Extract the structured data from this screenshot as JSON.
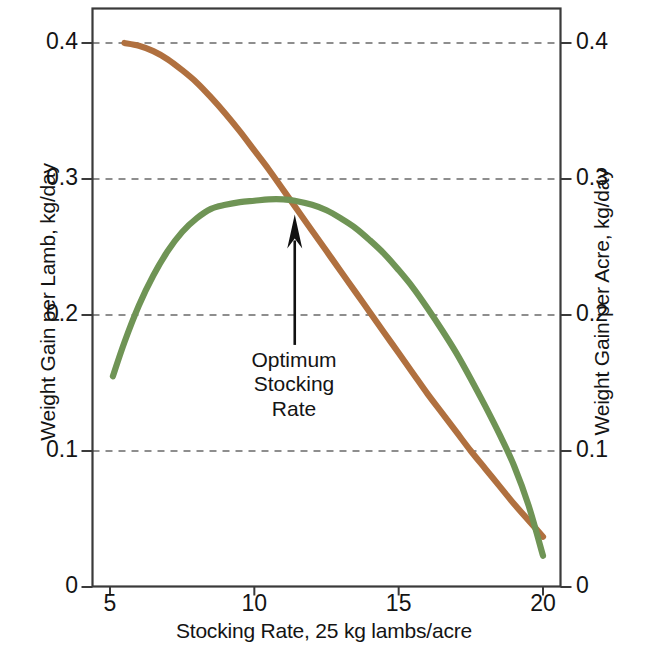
{
  "chart_data": {
    "type": "line",
    "title": "",
    "xlabel": "Stocking Rate, 25 kg lambs/acre",
    "ylabel": "Weight Gain per Lamb, kg/day",
    "ylabel_right": "Weight Gain per Acre, kg/day",
    "xlim": [
      4.0,
      20.9
    ],
    "ylim": [
      0,
      0.425
    ],
    "xticks": [
      5,
      10,
      15,
      20
    ],
    "xtick_labels": [
      "5",
      "10",
      "15",
      "20"
    ],
    "yticks": [
      0,
      0.1,
      0.2,
      0.3,
      0.4
    ],
    "ytick_labels": [
      "0",
      "0.1",
      "0.2",
      "0.3",
      "0.4"
    ],
    "ytick_labels_right": [
      "0",
      "0.1",
      "0.2",
      "0.3",
      "0.4"
    ],
    "grid": "horizontal-dashed",
    "legend": "none",
    "series": [
      {
        "name": "Weight Gain per Lamb",
        "axis": "left",
        "color": "#B0703F",
        "points": [
          [
            5.5,
            0.4
          ],
          [
            6.0,
            0.398
          ],
          [
            6.5,
            0.394
          ],
          [
            7.0,
            0.388
          ],
          [
            7.5,
            0.38
          ],
          [
            8.0,
            0.371
          ],
          [
            8.5,
            0.36
          ],
          [
            9.0,
            0.348
          ],
          [
            9.5,
            0.335
          ],
          [
            10.0,
            0.321
          ],
          [
            10.5,
            0.307
          ],
          [
            11.0,
            0.292
          ],
          [
            11.5,
            0.277
          ],
          [
            12.0,
            0.262
          ],
          [
            12.5,
            0.247
          ],
          [
            13.0,
            0.232
          ],
          [
            13.5,
            0.217
          ],
          [
            14.0,
            0.202
          ],
          [
            14.5,
            0.187
          ],
          [
            15.0,
            0.172
          ],
          [
            15.5,
            0.157
          ],
          [
            16.0,
            0.142
          ],
          [
            16.5,
            0.128
          ],
          [
            17.0,
            0.114
          ],
          [
            17.5,
            0.1
          ],
          [
            18.0,
            0.087
          ],
          [
            18.5,
            0.074
          ],
          [
            19.0,
            0.061
          ],
          [
            19.5,
            0.049
          ],
          [
            20.0,
            0.037
          ]
        ]
      },
      {
        "name": "Weight Gain per Acre",
        "axis": "right",
        "color": "#6F9455",
        "points": [
          [
            5.1,
            0.155
          ],
          [
            5.5,
            0.18
          ],
          [
            6.0,
            0.207
          ],
          [
            6.5,
            0.229
          ],
          [
            7.0,
            0.247
          ],
          [
            7.5,
            0.261
          ],
          [
            8.0,
            0.271
          ],
          [
            8.5,
            0.278
          ],
          [
            9.0,
            0.281
          ],
          [
            9.5,
            0.283
          ],
          [
            10.0,
            0.284
          ],
          [
            10.5,
            0.285
          ],
          [
            11.0,
            0.285
          ],
          [
            11.4,
            0.284
          ],
          [
            12.0,
            0.281
          ],
          [
            12.5,
            0.277
          ],
          [
            13.0,
            0.271
          ],
          [
            13.5,
            0.264
          ],
          [
            14.0,
            0.255
          ],
          [
            14.5,
            0.245
          ],
          [
            15.0,
            0.233
          ],
          [
            15.5,
            0.22
          ],
          [
            16.0,
            0.205
          ],
          [
            16.5,
            0.189
          ],
          [
            17.0,
            0.172
          ],
          [
            17.5,
            0.153
          ],
          [
            18.0,
            0.133
          ],
          [
            18.5,
            0.112
          ],
          [
            19.0,
            0.089
          ],
          [
            19.5,
            0.06
          ],
          [
            20.0,
            0.023
          ]
        ]
      }
    ],
    "annotations": [
      {
        "text_lines": [
          "Optimum",
          "Stocking",
          "Rate"
        ],
        "arrow_from": [
          11.4,
          0.178
        ],
        "arrow_to": [
          11.4,
          0.271
        ]
      }
    ]
  },
  "axes": {
    "left_title": "Weight Gain per Lamb, kg/day",
    "right_title": "Weight Gain per Acre, kg/day",
    "bottom_title": "Stocking Rate, 25 kg lambs/acre"
  },
  "annotation": {
    "line1": "Optimum",
    "line2": "Stocking",
    "line3": "Rate"
  },
  "colors": {
    "lamb_curve": "#B0703F",
    "acre_curve": "#6F9455",
    "axis": "#3a3a3a",
    "grid": "#6a6a6a",
    "text": "#141414"
  }
}
